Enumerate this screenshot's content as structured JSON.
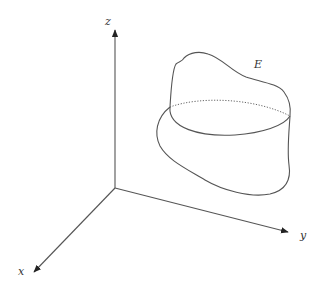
{
  "diagram": {
    "axes": {
      "x": {
        "label": "x"
      },
      "y": {
        "label": "y"
      },
      "z": {
        "label": "z"
      }
    },
    "region": {
      "label": "E"
    },
    "colors": {
      "line": "#555555",
      "arrow": "#222222",
      "background": "#ffffff"
    }
  }
}
